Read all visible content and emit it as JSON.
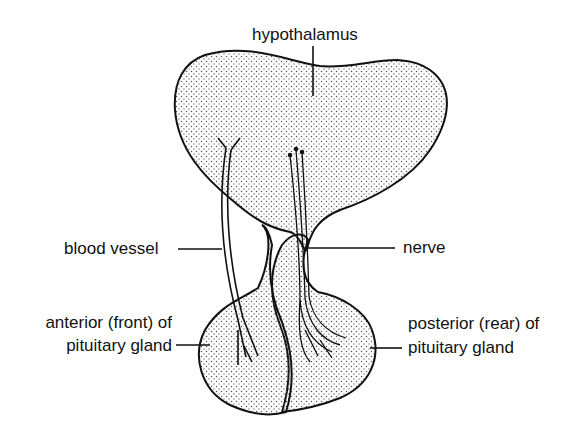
{
  "diagram": {
    "labels": {
      "hypothalamus": "hypothalamus",
      "blood_vessel": "blood vessel",
      "nerve": "nerve",
      "anterior_line1": "anterior (front) of",
      "anterior_line2": "pituitary gland",
      "posterior_line1": "posterior (rear) of",
      "posterior_line2": "pituitary gland"
    },
    "colors": {
      "stroke": "#111111",
      "stipple": "#555555",
      "background": "#ffffff"
    }
  }
}
